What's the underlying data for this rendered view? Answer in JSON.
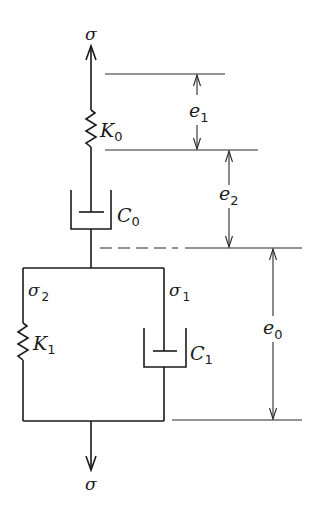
{
  "diagram": {
    "type": "rheological-model",
    "labels": {
      "stress_top": "σ",
      "stress_bottom": "σ",
      "spring0": {
        "base": "K",
        "sub": "0"
      },
      "dashpot0": {
        "base": "C",
        "sub": "0"
      },
      "spring1": {
        "base": "K",
        "sub": "1"
      },
      "dashpot1": {
        "base": "C",
        "sub": "1"
      },
      "branch_stress_left": {
        "base": "σ",
        "sub": "2"
      },
      "branch_stress_right": {
        "base": "σ",
        "sub": "1"
      },
      "strain_e1": {
        "base": "e",
        "sub": "1"
      },
      "strain_e2": {
        "base": "e",
        "sub": "2"
      },
      "strain_e0": {
        "base": "e",
        "sub": "0"
      }
    },
    "colors": {
      "stroke": "#1a1a1a",
      "background": "#ffffff"
    }
  }
}
